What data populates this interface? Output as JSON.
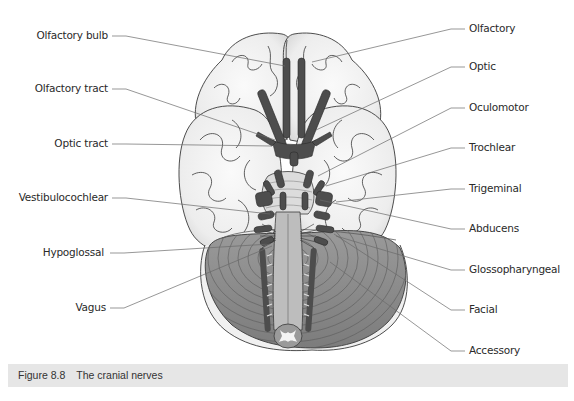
{
  "figure": {
    "number": "Figure 8.8",
    "title": "The cranial nerves"
  },
  "labels": {
    "left": [
      {
        "id": "olfactory-bulb",
        "text": "Olfactory bulb",
        "x": 108,
        "y": 36,
        "lx1": 112,
        "ly1": 36,
        "lx2": 285,
        "ly2": 66
      },
      {
        "id": "olfactory-tract",
        "text": "Olfactory tract",
        "x": 108,
        "y": 89,
        "lx1": 112,
        "ly1": 89,
        "lx2": 275,
        "ly2": 140
      },
      {
        "id": "optic-tract",
        "text": "Optic tract",
        "x": 108,
        "y": 144,
        "lx1": 112,
        "ly1": 144,
        "lx2": 272,
        "ly2": 146
      },
      {
        "id": "vestibulocochlear",
        "text": "Vestibulocochlear",
        "x": 108,
        "y": 198,
        "lx1": 112,
        "ly1": 198,
        "lx2": 270,
        "ly2": 214
      },
      {
        "id": "hypoglossal",
        "text": "Hypoglossal",
        "x": 104,
        "y": 253,
        "lx1": 110,
        "ly1": 253,
        "lx2": 270,
        "ly2": 244
      },
      {
        "id": "vagus",
        "text": "Vagus",
        "x": 106,
        "y": 308,
        "lx1": 110,
        "ly1": 308,
        "lx2": 272,
        "ly2": 246
      }
    ],
    "right": [
      {
        "id": "olfactory",
        "text": "Olfactory",
        "x": 469,
        "y": 29,
        "lx1": 465,
        "ly1": 29,
        "lx2": 312,
        "ly2": 62
      },
      {
        "id": "optic",
        "text": "Optic",
        "x": 469,
        "y": 67,
        "lx1": 465,
        "ly1": 67,
        "lx2": 316,
        "ly2": 130
      },
      {
        "id": "oculomotor",
        "text": "Oculomotor",
        "x": 469,
        "y": 108,
        "lx1": 465,
        "ly1": 108,
        "lx2": 318,
        "ly2": 176
      },
      {
        "id": "trochlear",
        "text": "Trochlear",
        "x": 469,
        "y": 148,
        "lx1": 465,
        "ly1": 148,
        "lx2": 326,
        "ly2": 186
      },
      {
        "id": "trigeminal",
        "text": "Trigeminal",
        "x": 469,
        "y": 189,
        "lx1": 465,
        "ly1": 189,
        "lx2": 336,
        "ly2": 202
      },
      {
        "id": "abducens",
        "text": "Abducens",
        "x": 469,
        "y": 229,
        "lx1": 465,
        "ly1": 229,
        "lx2": 320,
        "ly2": 200
      },
      {
        "id": "glossopharyngeal",
        "text": "Glossopharyngeal",
        "x": 469,
        "y": 270,
        "lx1": 465,
        "ly1": 270,
        "lx2": 336,
        "ly2": 236
      },
      {
        "id": "facial",
        "text": "Facial",
        "x": 469,
        "y": 310,
        "lx1": 465,
        "ly1": 310,
        "lx2": 334,
        "ly2": 234
      },
      {
        "id": "accessory",
        "text": "Accessory",
        "x": 469,
        "y": 351,
        "lx1": 465,
        "ly1": 351,
        "lx2": 330,
        "ly2": 262
      }
    ]
  },
  "colors": {
    "brain_fill": "#f4f4f4",
    "brain_outline": "#3a3a3a",
    "nerve": "#4d4d4d",
    "cerebellum": "#8a8a8a",
    "brainstem": "#b8b8b8",
    "leader": "#6a6a6a",
    "caption_bar": "#e6e6e6"
  }
}
